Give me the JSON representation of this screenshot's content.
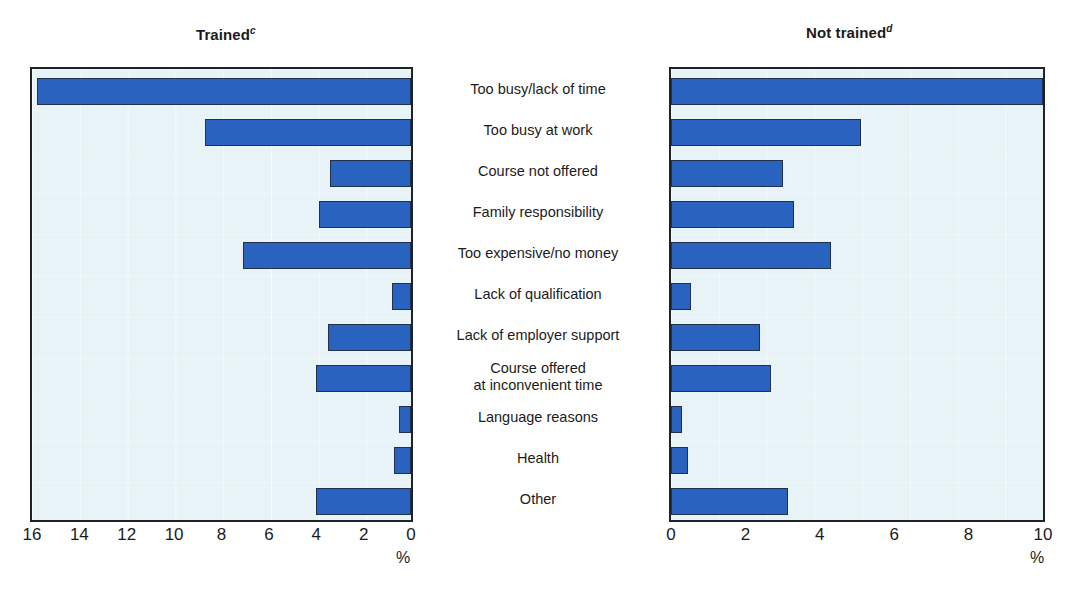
{
  "figure": {
    "panels": [
      {
        "key": "trained",
        "title": "Trained",
        "superscript": "c"
      },
      {
        "key": "not_trained",
        "title": "Not trained",
        "superscript": "d"
      }
    ],
    "unit_label": "%",
    "bar_color": "#2a62c0",
    "bar_border_color": "#20304e",
    "plot_background": "#e7f3f6",
    "frame_color": "#1e2326"
  },
  "categories": [
    "Too busy/lack of time",
    "Too busy at work",
    "Course not offered",
    "Family responsibility",
    "Too expensive/no money",
    "Lack of qualification",
    "Lack of employer support",
    "Course offered\nat inconvenient time",
    "Language reasons",
    "Health",
    "Other"
  ],
  "chart_data": [
    {
      "type": "bar",
      "title": "Trained",
      "title_superscript": "c",
      "orientation": "horizontal",
      "direction": "right-to-left",
      "categories": [
        "Too busy/lack of time",
        "Too busy at work",
        "Course not offered",
        "Family responsibility",
        "Too expensive/no money",
        "Lack of qualification",
        "Lack of employer support",
        "Course offered at inconvenient time",
        "Language reasons",
        "Health",
        "Other"
      ],
      "values": [
        15.8,
        8.7,
        3.4,
        3.9,
        7.1,
        0.8,
        3.5,
        4.0,
        0.5,
        0.7,
        4.0
      ],
      "xlabel": "%",
      "ylabel": "",
      "xlim": [
        16,
        0
      ],
      "xticks": [
        16,
        14,
        12,
        10,
        8,
        6,
        4,
        2,
        0
      ],
      "xticklabels": [
        "16",
        "14",
        "12",
        "10",
        "8",
        "6",
        "4",
        "2",
        "0"
      ],
      "grid": true,
      "legend": false
    },
    {
      "type": "bar",
      "title": "Not trained",
      "title_superscript": "d",
      "orientation": "horizontal",
      "direction": "left-to-right",
      "categories": [
        "Too busy/lack of time",
        "Too busy at work",
        "Course not offered",
        "Family responsibility",
        "Too expensive/no money",
        "Lack of qualification",
        "Lack of employer support",
        "Course offered at inconvenient time",
        "Language reasons",
        "Health",
        "Other"
      ],
      "values": [
        10.0,
        5.1,
        3.0,
        3.3,
        4.3,
        0.55,
        2.4,
        2.7,
        0.3,
        0.45,
        3.15
      ],
      "xlabel": "%",
      "ylabel": "",
      "xlim": [
        0,
        10
      ],
      "xticks": [
        0,
        2,
        4,
        6,
        8,
        10
      ],
      "xticklabels": [
        "0",
        "2",
        "4",
        "6",
        "8",
        "10"
      ],
      "grid": true,
      "legend": false
    }
  ]
}
